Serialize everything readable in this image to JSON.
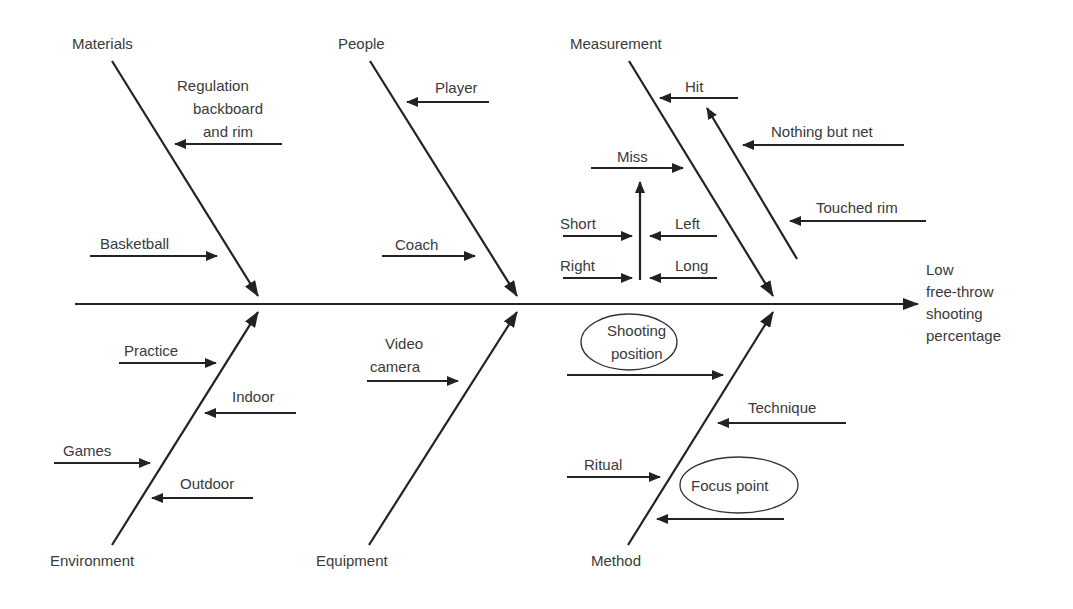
{
  "diagram": {
    "type": "fishbone",
    "effect": {
      "lines": [
        "Low",
        "free-throw",
        "shooting",
        "percentage"
      ],
      "x": 926,
      "y": 275
    },
    "spine": {
      "x1": 75,
      "y1": 304,
      "x2": 918,
      "y2": 304
    },
    "categories": [
      {
        "id": "materials",
        "label": "Materials",
        "lx": 72,
        "ly": 49,
        "bone": [
          112,
          61,
          258,
          296
        ],
        "causes": [
          {
            "lines": [
              "Regulation",
              "backboard",
              "and rim"
            ],
            "tx": [
              177,
              193,
              203
            ],
            "ty": [
              91,
              114,
              137
            ],
            "arrow": [
              282,
              144,
              175,
              144
            ]
          },
          {
            "lines": [
              "Basketball"
            ],
            "tx": [
              100
            ],
            "ty": [
              249
            ],
            "arrow": [
              90,
              256,
              217,
              256
            ]
          }
        ]
      },
      {
        "id": "people",
        "label": "People",
        "lx": 338,
        "ly": 49,
        "bone": [
          370,
          61,
          517,
          296
        ],
        "causes": [
          {
            "lines": [
              "Player"
            ],
            "tx": [
              435
            ],
            "ty": [
              93
            ],
            "arrow": [
              489,
              102,
              407,
              102
            ]
          },
          {
            "lines": [
              "Coach"
            ],
            "tx": [
              395
            ],
            "ty": [
              250
            ],
            "arrow": [
              382,
              256,
              475,
              256
            ]
          }
        ]
      },
      {
        "id": "measurement",
        "label": "Measurement",
        "lx": 570,
        "ly": 49,
        "bone": [
          629,
          61,
          773,
          296
        ],
        "causes": [
          {
            "lines": [
              "Hit"
            ],
            "tx": [
              685
            ],
            "ty": [
              92
            ],
            "arrow": [
              738,
              98,
              660,
              98
            ]
          },
          {
            "lines": [
              "Nothing but net"
            ],
            "tx": [
              771
            ],
            "ty": [
              137
            ],
            "arrow": [
              904,
              145,
              743,
              145
            ]
          },
          {
            "lines": [
              "Touched rim"
            ],
            "tx": [
              816
            ],
            "ty": [
              213
            ],
            "arrow": [
              926,
              221,
              790,
              221
            ]
          },
          {
            "lines": [
              "Miss"
            ],
            "tx": [
              617
            ],
            "ty": [
              162
            ],
            "arrow": [
              591,
              168,
              683,
              168
            ]
          },
          {
            "lines": [
              "Short"
            ],
            "tx": [
              560
            ],
            "ty": [
              229
            ],
            "arrow": [
              563,
              236,
              632,
              236
            ]
          },
          {
            "lines": [
              "Left"
            ],
            "tx": [
              675
            ],
            "ty": [
              229
            ],
            "arrow": [
              717,
              236,
              650,
              236
            ]
          },
          {
            "lines": [
              "Right"
            ],
            "tx": [
              560
            ],
            "ty": [
              271
            ],
            "arrow": [
              563,
              278,
              632,
              278
            ]
          },
          {
            "lines": [
              "Long"
            ],
            "tx": [
              675
            ],
            "ty": [
              271
            ],
            "arrow": [
              717,
              278,
              650,
              278
            ]
          }
        ],
        "extra_arrows": [
          [
            640,
            280,
            640,
            182
          ],
          [
            797,
            259,
            707,
            108
          ]
        ]
      },
      {
        "id": "environment",
        "label": "Environment",
        "lx": 50,
        "ly": 566,
        "bone": [
          112,
          545,
          258,
          312
        ],
        "causes": [
          {
            "lines": [
              "Practice"
            ],
            "tx": [
              124
            ],
            "ty": [
              356
            ],
            "arrow": [
              119,
              363,
              216,
              363
            ]
          },
          {
            "lines": [
              "Indoor"
            ],
            "tx": [
              232
            ],
            "ty": [
              402
            ],
            "arrow": [
              296,
              413,
              205,
              413
            ]
          },
          {
            "lines": [
              "Games"
            ],
            "tx": [
              63
            ],
            "ty": [
              456
            ],
            "arrow": [
              54,
              463,
              150,
              463
            ]
          },
          {
            "lines": [
              "Outdoor"
            ],
            "tx": [
              180
            ],
            "ty": [
              489
            ],
            "arrow": [
              253,
              498,
              152,
              498
            ]
          }
        ]
      },
      {
        "id": "equipment",
        "label": "Equipment",
        "lx": 316,
        "ly": 566,
        "bone": [
          369,
          545,
          517,
          312
        ],
        "causes": [
          {
            "lines": [
              "Video",
              "camera"
            ],
            "tx": [
              385,
              370
            ],
            "ty": [
              349,
              372
            ],
            "arrow": [
              367,
              381,
              458,
              381
            ]
          }
        ]
      },
      {
        "id": "method",
        "label": "Method",
        "lx": 591,
        "ly": 566,
        "bone": [
          628,
          545,
          773,
          312
        ],
        "causes": [
          {
            "lines": [
              "Shooting",
              "position"
            ],
            "tx": [
              607,
              611
            ],
            "ty": [
              336,
              359
            ],
            "arrow": [
              567,
              375,
              723,
              375
            ],
            "ellipse": [
              629,
              342,
              48,
              28
            ]
          },
          {
            "lines": [
              "Technique"
            ],
            "tx": [
              748
            ],
            "ty": [
              413
            ],
            "arrow": [
              846,
              423,
              718,
              423
            ]
          },
          {
            "lines": [
              "Ritual"
            ],
            "tx": [
              584
            ],
            "ty": [
              470
            ],
            "arrow": [
              567,
              477,
              660,
              477
            ]
          },
          {
            "lines": [
              "Focus point"
            ],
            "tx": [
              691
            ],
            "ty": [
              491
            ],
            "arrow": [
              784,
              519,
              657,
              519
            ],
            "ellipse": [
              739,
              485,
              59,
              28
            ]
          }
        ]
      }
    ]
  }
}
